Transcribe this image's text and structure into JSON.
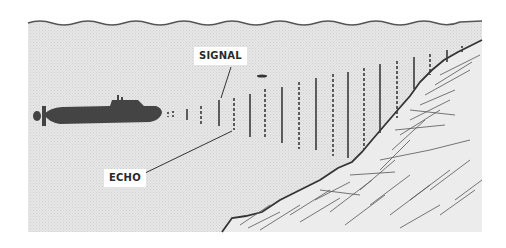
{
  "diagram": {
    "labels": {
      "signal": "SIGNAL",
      "echo": "ECHO"
    },
    "elements": {
      "water_surface": "wavy surface line",
      "submarine": "submarine silhouette",
      "signal_pulses": "solid vertical lines (outgoing signal)",
      "echo_pulses": "dashed vertical lines (returning echo)",
      "seabed": "sloping rocky seabed"
    },
    "colors": {
      "water": "#e4e4e4",
      "ink": "#3a3a3a",
      "background": "#ffffff"
    }
  }
}
